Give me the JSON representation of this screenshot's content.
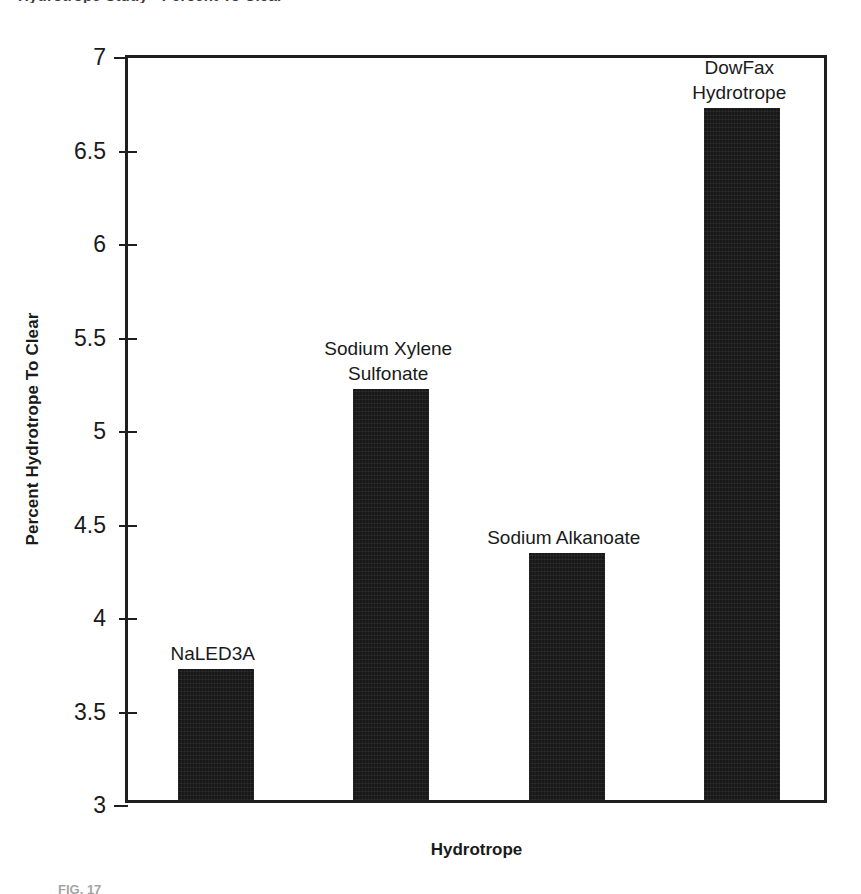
{
  "figure": {
    "cropped_top_title": "Hydrotrope Study - Percent To Clear",
    "cropped_bottom_caption": "FIG. 17"
  },
  "chart_data": {
    "type": "bar",
    "title": "",
    "xlabel": "Hydrotrope",
    "ylabel": "Percent Hydrotrope To Clear",
    "ylim": [
      3,
      7
    ],
    "ytick_labels": [
      "7",
      "6.5",
      "6",
      "5.5",
      "5",
      "4.5",
      "4",
      "3.5",
      "3"
    ],
    "ytick_values": [
      7,
      6.5,
      6,
      5.5,
      5,
      4.5,
      4,
      3.5,
      3
    ],
    "grid": false,
    "legend": "none",
    "bar_color": "#181818",
    "categories": [
      "NaLED3A",
      "Sodium Xylene\nSulfonate",
      "Sodium Alkanoate",
      "DowFax\nHydrotrope"
    ],
    "values": [
      3.7,
      5.2,
      4.32,
      6.7
    ],
    "bars": [
      {
        "label": "NaLED3A",
        "value": 3.7
      },
      {
        "label": "Sodium Xylene\nSulfonate",
        "value": 5.2
      },
      {
        "label": "Sodium Alkanoate",
        "value": 4.32
      },
      {
        "label": "DowFax\nHydrotrope",
        "value": 6.7
      }
    ]
  }
}
